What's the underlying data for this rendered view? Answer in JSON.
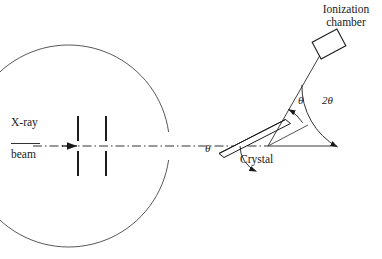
{
  "figure": {
    "type": "schematic-diagram",
    "background_color": "#ffffff",
    "stroke_color": "#1a1a1a"
  },
  "labels": {
    "ionization_chamber_line1": "Ionization",
    "ionization_chamber_line2": "chamber",
    "xray": "X-ray",
    "beam": "beam",
    "crystal": "Crystal",
    "theta_lower": "θ",
    "theta_upper": "θ",
    "two_theta": "2θ"
  },
  "geometry": {
    "circle": {
      "center_x": 268,
      "center_y": 146,
      "radius": 101,
      "gap_start_deg": 172,
      "gap_end_deg": 188
    },
    "pivot": {
      "x": 268,
      "y": 146
    },
    "incident_beam": {
      "y": 146,
      "x_start": 33,
      "x_end": 268,
      "style": "dash-dot"
    },
    "arrow_tip": {
      "x": 76,
      "y": 146
    },
    "slits": [
      {
        "x": 78,
        "top_y": 116,
        "top_y2": 137,
        "bot_y": 155,
        "bot_y2": 176
      },
      {
        "x": 105,
        "top_y": 116,
        "top_y2": 137,
        "bot_y": 155,
        "bot_y2": 176
      }
    ],
    "baseline": {
      "y": 146,
      "x_start": 268,
      "x_end": 337
    },
    "crystal": {
      "angle_deg": -25,
      "length": 62,
      "thickness": 6,
      "center_x": 252,
      "center_y": 153
    },
    "diffracted_ray": {
      "from_x": 268,
      "from_y": 146,
      "to_x": 325,
      "to_y": 43,
      "angle_deg": 61
    },
    "chamber_box": {
      "center_x": 329,
      "center_y": 44,
      "width": 27,
      "height": 18,
      "rotation_deg": -28
    },
    "angle_arcs": [
      {
        "name": "theta-lower",
        "radius": 28,
        "from_deg": 180,
        "to_deg": 245
      },
      {
        "name": "theta-upper",
        "radius": 42,
        "from_deg": 34,
        "to_deg": 61
      },
      {
        "name": "two-theta",
        "radius": 70,
        "from_deg": 0,
        "to_deg": 61
      }
    ]
  }
}
